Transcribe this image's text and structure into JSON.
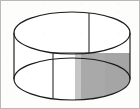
{
  "figure": {
    "kind": "geometry-diagram",
    "title": "",
    "caption": "",
    "labels": [],
    "canvas": {
      "width": 140,
      "height": 109
    },
    "colors": {
      "background": "#fdfdfc",
      "frame_border": "#b9b9b9",
      "stroke": "#1b1b1b",
      "shade_fill": "#a9a9a9",
      "shade_fill_light": "#c2c2c2",
      "body_fill": "#ffffff"
    },
    "geometry": {
      "top_ellipse": {
        "cx": 71,
        "cy": 32,
        "rx": 58,
        "ry": 21
      },
      "bottom_ellipse": {
        "cx": 71,
        "cy": 78,
        "rx": 58,
        "ry": 21
      },
      "left_side": {
        "x": 13,
        "y1": 32,
        "y2": 78
      },
      "right_side": {
        "x": 129,
        "y1": 32,
        "y2": 78
      },
      "radius_line": {
        "x": 88,
        "y1": 12,
        "y2": 53
      },
      "front_vertical_line": {
        "x": 52,
        "y1": 52,
        "y2": 98
      },
      "chord_line": {
        "y": 52,
        "x1": 52,
        "x2": 88
      },
      "shade_left_edge_x": 76,
      "shade_right_edge_x": 129,
      "shade_top_y": 52,
      "shade_bottom_y": 99
    }
  }
}
